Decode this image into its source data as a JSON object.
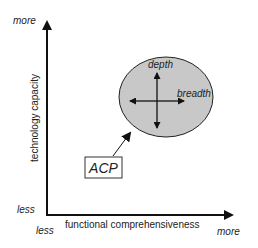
{
  "diagram": {
    "y_axis": {
      "label": "technology capacity",
      "high_label": "more",
      "low_label": "less"
    },
    "x_axis": {
      "label": "functional comprehensiveness",
      "high_label": "more",
      "low_label": "less"
    },
    "region": {
      "dimension_vertical": "depth",
      "dimension_horizontal": "breadth",
      "fill": "#c8c8c8"
    },
    "callout": {
      "label": "ACP"
    }
  }
}
